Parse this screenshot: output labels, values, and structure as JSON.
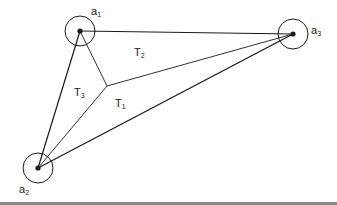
{
  "diagram": {
    "type": "triangulation-with-neighborhoods",
    "points": [
      {
        "id": "a1",
        "label": "a",
        "sub": "1",
        "x": 80,
        "y": 31,
        "r": 15,
        "label_x": 91,
        "label_y": 13
      },
      {
        "id": "a2",
        "label": "a",
        "sub": "2",
        "x": 38,
        "y": 168,
        "r": 15,
        "label_x": 19,
        "label_y": 192
      },
      {
        "id": "a3",
        "label": "a",
        "sub": "3",
        "x": 293,
        "y": 34,
        "r": 15,
        "label_x": 310,
        "label_y": 32
      }
    ],
    "interior_point": {
      "x": 107,
      "y": 86
    },
    "outer_edges": [
      {
        "from": "a1",
        "to": "a3"
      },
      {
        "from": "a1",
        "to": "a2"
      },
      {
        "from": "a2",
        "to": "a3"
      }
    ],
    "interior_edges": [
      {
        "from": "a1",
        "to": "interior"
      },
      {
        "from": "a2",
        "to": "interior"
      },
      {
        "from": "a3",
        "to": "interior"
      }
    ],
    "regions": [
      {
        "id": "T1",
        "label": "T",
        "sub": "1",
        "x": 115,
        "y": 104
      },
      {
        "id": "T2",
        "label": "T",
        "sub": "2",
        "x": 134,
        "y": 52
      },
      {
        "id": "T3",
        "label": "T",
        "sub": "3",
        "x": 74,
        "y": 94
      }
    ],
    "colors": {
      "stroke": "#1a1a1a",
      "background": "#ffffff",
      "rule": "#8a8a8a"
    }
  }
}
